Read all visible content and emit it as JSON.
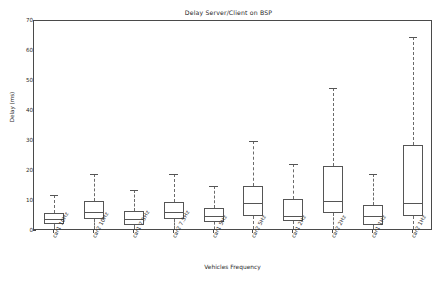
{
  "chart_data": {
    "type": "box",
    "title": "Delay Server/Client on BSP",
    "xlabel": "Vehicles Frequency",
    "ylabel": "Delay (ms)",
    "ylim": [
      0,
      70
    ],
    "yticks": [
      0,
      10,
      20,
      30,
      40,
      50,
      60,
      70
    ],
    "grid": false,
    "legend": "none",
    "categories": [
      "car1 10Hz",
      "car2 10Hz",
      "car1 7.5Hz",
      "car2 7.5Hz",
      "car1 5Hz",
      "car2 5Hz",
      "car1 2Hz",
      "car2 2Hz",
      "car1 1Hz",
      "car2 1Hz"
    ],
    "boxes": [
      {
        "label": "car1 10Hz",
        "whisker_low": 0.6,
        "q1": 2.2,
        "median": 3.9,
        "q3": 6.0,
        "whisker_high": 12.0
      },
      {
        "label": "car2 10Hz",
        "whisker_low": 0.6,
        "q1": 4.0,
        "median": 6.2,
        "q3": 9.9,
        "whisker_high": 19.0
      },
      {
        "label": "car1 7.5Hz",
        "whisker_low": 0.6,
        "q1": 2.0,
        "median": 4.0,
        "q3": 6.8,
        "whisker_high": 13.7
      },
      {
        "label": "car2 7.5Hz",
        "whisker_low": 0.6,
        "q1": 4.0,
        "median": 6.2,
        "q3": 9.8,
        "whisker_high": 18.9
      },
      {
        "label": "car1 5Hz",
        "whisker_low": 0.6,
        "q1": 3.0,
        "median": 5.0,
        "q3": 7.6,
        "whisker_high": 15.0
      },
      {
        "label": "car2 5Hz",
        "whisker_low": 0.6,
        "q1": 4.9,
        "median": 9.2,
        "q3": 15.0,
        "whisker_high": 30.0
      },
      {
        "label": "car1 2Hz",
        "whisker_low": 0.6,
        "q1": 3.3,
        "median": 5.0,
        "q3": 10.7,
        "whisker_high": 22.5
      },
      {
        "label": "car2 2Hz",
        "whisker_low": 0.6,
        "q1": 6.0,
        "median": 9.9,
        "q3": 21.8,
        "whisker_high": 47.7
      },
      {
        "label": "car1 1Hz",
        "whisker_low": 0.6,
        "q1": 2.1,
        "median": 5.0,
        "q3": 8.7,
        "whisker_high": 18.9
      },
      {
        "label": "car2 1Hz",
        "whisker_low": 0.6,
        "q1": 5.0,
        "median": 9.2,
        "q3": 28.8,
        "whisker_high": 64.7
      }
    ],
    "colors": {
      "axis": "#4a4a4a",
      "box_edge": "#555555",
      "whisker": "#6a6a6a",
      "text": "#2a2a2a",
      "background": "#ffffff"
    }
  }
}
